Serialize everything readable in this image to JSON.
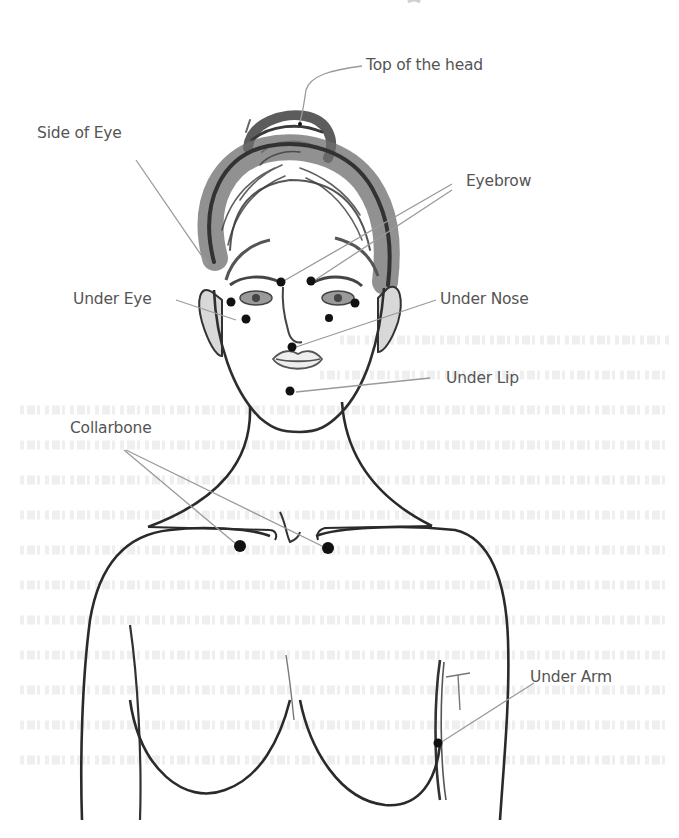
{
  "figure": {
    "title_fragment": "",
    "colors": {
      "background": "#ffffff",
      "line": "#2b2b2b",
      "hair": "#555555",
      "leader_line": "#9a9a9a",
      "point": "#111111",
      "label_text": "#555555"
    }
  },
  "labels": [
    {
      "id": "top-of-head",
      "text": "Top of the head"
    },
    {
      "id": "side-of-eye",
      "text": "Side of Eye"
    },
    {
      "id": "eyebrow",
      "text": "Eyebrow"
    },
    {
      "id": "under-eye",
      "text": "Under Eye"
    },
    {
      "id": "under-nose",
      "text": "Under Nose"
    },
    {
      "id": "under-lip",
      "text": "Under Lip"
    },
    {
      "id": "collarbone",
      "text": "Collarbone"
    },
    {
      "id": "under-arm",
      "text": "Under Arm"
    }
  ]
}
